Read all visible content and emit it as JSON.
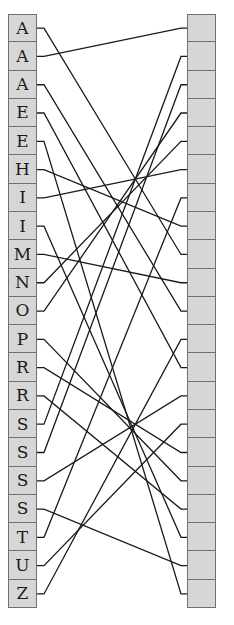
{
  "diagram": {
    "type": "matching-lines",
    "left_labels": [
      "A",
      "A",
      "A",
      "E",
      "E",
      "H",
      "I",
      "I",
      "M",
      "N",
      "O",
      "P",
      "R",
      "R",
      "S",
      "S",
      "S",
      "S",
      "T",
      "U",
      "Z"
    ],
    "right_labels": [
      "",
      "",
      "",
      "",
      "",
      "",
      "",
      "",
      "",
      "",
      "",
      "",
      "",
      "",
      "",
      "",
      "",
      "",
      "",
      "",
      ""
    ],
    "connections": [
      {
        "from": 0,
        "to": 8
      },
      {
        "from": 1,
        "to": 0
      },
      {
        "from": 2,
        "to": 10
      },
      {
        "from": 3,
        "to": 12
      },
      {
        "from": 4,
        "to": 20
      },
      {
        "from": 5,
        "to": 7
      },
      {
        "from": 6,
        "to": 5
      },
      {
        "from": 7,
        "to": 18
      },
      {
        "from": 8,
        "to": 9
      },
      {
        "from": 9,
        "to": 4
      },
      {
        "from": 10,
        "to": 3
      },
      {
        "from": 11,
        "to": 16
      },
      {
        "from": 12,
        "to": 15
      },
      {
        "from": 13,
        "to": 17
      },
      {
        "from": 14,
        "to": 1
      },
      {
        "from": 15,
        "to": 2
      },
      {
        "from": 16,
        "to": 13
      },
      {
        "from": 17,
        "to": 19
      },
      {
        "from": 18,
        "to": 6
      },
      {
        "from": 19,
        "to": 14
      },
      {
        "from": 20,
        "to": 11
      }
    ],
    "colors": {
      "cell_fill": "#d6d6d6",
      "cell_border": "#6f6f6f",
      "line": "#1a1a1a",
      "text": "#1a1a1a"
    }
  }
}
